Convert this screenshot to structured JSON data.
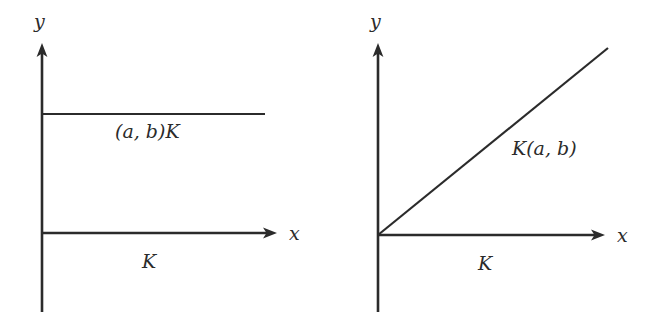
{
  "figure": {
    "background_color": "#ffffff",
    "ink_color": "#2b2b2b",
    "panels": [
      {
        "id": "left",
        "name": "degenerate-cone-panel",
        "axes": {
          "x_axis_label": "x",
          "y_axis_label": "y",
          "origin": {
            "x": 42,
            "y": 233
          },
          "x_axis_end": {
            "x": 277,
            "y": 233
          },
          "y_axis_top": {
            "x": 42,
            "y": 45
          },
          "y_axis_bottom": {
            "x": 42,
            "y": 312
          },
          "x_has_arrow": true,
          "y_has_arrow": true
        },
        "base_set_label": "K",
        "image_set_label": "(a, b)K",
        "image_geometry": {
          "kind": "horizontal-line",
          "y": 114,
          "x_start": 42,
          "x_end": 265,
          "has_arrow": false
        },
        "base_geometry": {
          "kind": "horizontal-ray-on-x-axis",
          "y": 233,
          "x_start": 42,
          "x_end": 277
        }
      },
      {
        "id": "right",
        "name": "scaled-cone-panel",
        "axes": {
          "x_axis_label": "x",
          "y_axis_label": "y",
          "origin": {
            "x": 378,
            "y": 235
          },
          "x_axis_end": {
            "x": 605,
            "y": 235
          },
          "y_axis_top": {
            "x": 378,
            "y": 45
          },
          "y_axis_bottom": {
            "x": 378,
            "y": 312
          },
          "x_has_arrow": true,
          "y_has_arrow": true
        },
        "base_set_label": "K",
        "image_set_label": "K(a, b)",
        "image_geometry": {
          "kind": "ray-from-origin",
          "x_start": 378,
          "y_start": 235,
          "x_end": 608,
          "y_end": 48,
          "has_arrow": false
        },
        "base_geometry": {
          "kind": "horizontal-ray-on-x-axis",
          "y": 235,
          "x_start": 378,
          "x_end": 605
        }
      }
    ],
    "label_positions": {
      "left_y": {
        "x": 34,
        "y": 28
      },
      "left_x": {
        "x": 289,
        "y": 240
      },
      "left_image": {
        "x": 115,
        "y": 138
      },
      "left_base": {
        "x": 142,
        "y": 268
      },
      "right_y": {
        "x": 370,
        "y": 28
      },
      "right_x": {
        "x": 617,
        "y": 242
      },
      "right_image": {
        "x": 512,
        "y": 155
      },
      "right_base": {
        "x": 478,
        "y": 270
      }
    }
  }
}
